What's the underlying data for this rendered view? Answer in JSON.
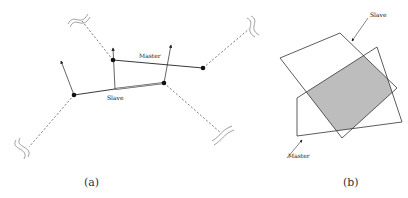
{
  "panel_a": {
    "caption": "(a)",
    "master_label": "Master",
    "slave_label": "Slave",
    "master_nodes": [
      [
        113,
        60
      ],
      [
        203,
        68
      ]
    ],
    "slave_nodes": [
      [
        74,
        95
      ],
      [
        164,
        83
      ]
    ],
    "slave_midpoint": [
      115,
      89
    ],
    "arrows": [
      {
        "from": [
          74,
          95
        ],
        "to": [
          61,
          61
        ]
      },
      {
        "from": [
          115,
          89
        ],
        "to": [
          113,
          48
        ]
      },
      {
        "from": [
          164,
          83
        ],
        "to": [
          171,
          45
        ]
      }
    ],
    "dashed_links": [
      {
        "from": [
          113,
          60
        ],
        "to": [
          83,
          22
        ],
        "squiggle": [
          78,
          18
        ]
      },
      {
        "from": [
          203,
          68
        ],
        "to": [
          247,
          30
        ],
        "squiggle": [
          252,
          25
        ]
      },
      {
        "from": [
          74,
          95
        ],
        "to": [
          30,
          147
        ],
        "squiggle": [
          25,
          145
        ]
      },
      {
        "from": [
          164,
          83
        ],
        "to": [
          220,
          132
        ],
        "squiggle": [
          225,
          135
        ]
      }
    ]
  },
  "panel_b": {
    "caption": "(b)",
    "slave_label": "Slave",
    "master_label": "Master",
    "slave_polygon": [
      [
        280,
        58
      ],
      [
        340,
        33
      ],
      [
        397,
        88
      ],
      [
        342,
        138
      ]
    ],
    "master_polygon": [
      [
        297,
        98
      ],
      [
        377,
        47
      ],
      [
        402,
        122
      ],
      [
        297,
        136
      ]
    ],
    "overlap_fill": "#bdbdbd",
    "stroke_color": "#333333"
  }
}
